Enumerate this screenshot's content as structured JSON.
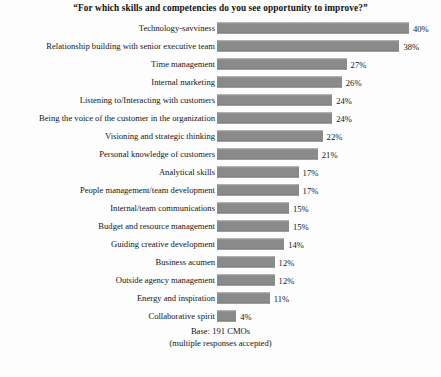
{
  "chart_data": {
    "type": "bar",
    "orientation": "horizontal",
    "title": "“For which skills and competencies do you see opportunity to improve?”",
    "xlabel": "",
    "ylabel": "",
    "xlim": [
      0,
      42
    ],
    "grid": false,
    "legend": false,
    "value_suffix": "%",
    "categories": [
      "Technology-savviness",
      "Relationship building with senior executive team",
      "Time management",
      "Internal marketing",
      "Listening to/Interacting with customers",
      "Being the voice of the customer in the organization",
      "Visioning and strategic thinking",
      "Personal knowledge of customers",
      "Analytical skills",
      "People management/team development",
      "Internal/team communications",
      "Budget and resource management",
      "Guiding creative development",
      "Business acumen",
      "Outside agency management",
      "Energy and inspiration",
      "Collaborative spirit"
    ],
    "values": [
      40,
      38,
      27,
      26,
      24,
      24,
      22,
      21,
      17,
      17,
      15,
      15,
      14,
      12,
      12,
      11,
      4
    ],
    "value_labels": [
      "40%",
      "38%",
      "27%",
      "26%",
      "24%",
      "24%",
      "22%",
      "21%",
      "17%",
      "17%",
      "15%",
      "15%",
      "14%",
      "12%",
      "12%",
      "11%",
      "4%"
    ],
    "bar_color": "#8a8a8a",
    "background_color": "#fdfdfd",
    "text_color": "#151515"
  },
  "footnote": {
    "line1": "Base: 191 CMOs",
    "line2": "(multiple responses accepted)"
  }
}
